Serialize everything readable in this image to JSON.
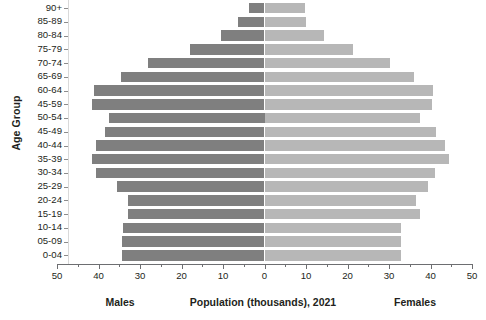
{
  "chart_data": {
    "type": "bar",
    "subtype": "population-pyramid",
    "title": "Population (thousands), 2021",
    "xlabel": "Population (thousands), 2021",
    "ylabel": "Age Group",
    "orientation": "horizontal",
    "grid": false,
    "legend_position": "bottom-inline",
    "xlim": [
      -50,
      50
    ],
    "x_axis_absolute_max": 50,
    "x_tick_step": 10,
    "x_minor_tick_step": 5,
    "x_tick_labels": [
      "50",
      "40",
      "30",
      "20",
      "10",
      "0",
      "10",
      "20",
      "30",
      "40",
      "50"
    ],
    "x_tick_values": [
      -50,
      -40,
      -30,
      -20,
      -10,
      0,
      10,
      20,
      30,
      40,
      50
    ],
    "categories": [
      "90+",
      "85-89",
      "80-84",
      "75-79",
      "70-74",
      "65-69",
      "60-64",
      "45-59",
      "50-54",
      "45-49",
      "40-44",
      "35-39",
      "30-34",
      "25-29",
      "20-24",
      "15-19",
      "10-14",
      "05-09",
      "0-04"
    ],
    "series": [
      {
        "name": "Males",
        "side": "left",
        "color": "#7f7f7f",
        "values": [
          3.7,
          6.4,
          10.5,
          18.0,
          28.0,
          34.5,
          41.0,
          41.5,
          37.5,
          38.5,
          40.5,
          41.5,
          40.5,
          35.5,
          33.0,
          33.0,
          34.0,
          34.3,
          34.3
        ]
      },
      {
        "name": "Females",
        "side": "right",
        "color": "#b7b7b7",
        "values": [
          9.8,
          10.0,
          14.3,
          21.3,
          30.3,
          36.0,
          40.5,
          40.3,
          37.5,
          41.3,
          43.5,
          44.5,
          41.0,
          39.3,
          36.5,
          37.5,
          33.0,
          32.8,
          32.8
        ]
      }
    ]
  },
  "captions": {
    "left": "Males",
    "center": "Population (thousands), 2021",
    "right": "Females"
  },
  "axis": {
    "y_title": "Age Group"
  }
}
